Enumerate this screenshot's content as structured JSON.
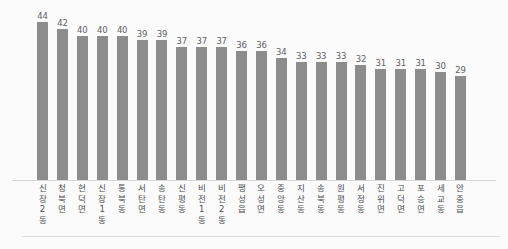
{
  "chart_data": {
    "type": "bar",
    "title": "",
    "subtitle": "",
    "xlabel": "",
    "ylabel": "",
    "ylim": [
      0,
      47
    ],
    "grid": false,
    "legend": false,
    "legend_position": "none",
    "orientation": "vertical",
    "bar_color": "#8c8c8c",
    "value_label_color": "#5f5f63",
    "background_color": "#fbfbfc",
    "axis_line_color": "#d6d6da",
    "data_labels_shown": true,
    "categories": [
      "신장2동",
      "청북면",
      "현덕면",
      "신장1동",
      "통북동",
      "서탄면",
      "송탄동",
      "신평동",
      "비전1동",
      "비전2동",
      "팽성읍",
      "오성면",
      "중앙동",
      "지산동",
      "송북동",
      "원평동",
      "서정동",
      "진위면",
      "고덕면",
      "포승면",
      "세교동",
      "안중읍"
    ],
    "values": [
      44,
      42,
      40,
      40,
      40,
      39,
      39,
      37,
      37,
      37,
      36,
      36,
      34,
      33,
      33,
      33,
      32,
      31,
      31,
      31,
      30,
      29
    ],
    "tick_labels": [
      [
        "신",
        "장",
        "2",
        "동"
      ],
      [
        "청",
        "북",
        "면"
      ],
      [
        "현",
        "덕",
        "면"
      ],
      [
        "신",
        "장",
        "1",
        "동"
      ],
      [
        "통",
        "북",
        "동"
      ],
      [
        "서",
        "탄",
        "면"
      ],
      [
        "송",
        "탄",
        "동"
      ],
      [
        "신",
        "평",
        "동"
      ],
      [
        "비",
        "전",
        "1",
        "동"
      ],
      [
        "비",
        "전",
        "2",
        "동"
      ],
      [
        "팽",
        "성",
        "읍"
      ],
      [
        "오",
        "성",
        "면"
      ],
      [
        "중",
        "앙",
        "동"
      ],
      [
        "지",
        "산",
        "동"
      ],
      [
        "송",
        "북",
        "동"
      ],
      [
        "원",
        "평",
        "동"
      ],
      [
        "서",
        "정",
        "동"
      ],
      [
        "진",
        "위",
        "면"
      ],
      [
        "고",
        "덕",
        "면"
      ],
      [
        "포",
        "승",
        "면"
      ],
      [
        "세",
        "교",
        "동"
      ],
      [
        "안",
        "중",
        "읍"
      ]
    ]
  }
}
